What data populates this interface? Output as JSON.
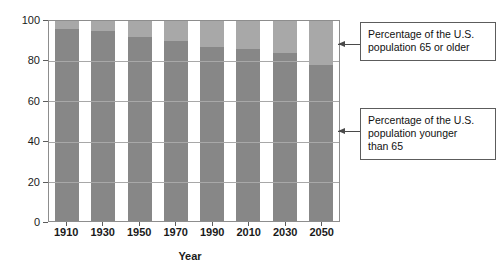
{
  "chart_data": {
    "type": "bar",
    "title": "",
    "subtitle": "",
    "xlabel": "Year",
    "ylabel": "Percentage",
    "categories": [
      "1910",
      "1930",
      "1950",
      "1970",
      "1990",
      "2010",
      "2030",
      "2050"
    ],
    "series": [
      {
        "name": "Percentage of the U.S. population younger than 65",
        "values": [
          96,
          95,
          92,
          90,
          87,
          86,
          84,
          78
        ],
        "color": "#878787"
      },
      {
        "name": "Percentage of the U.S. population 65 or older",
        "values": [
          4,
          5,
          8,
          10,
          13,
          14,
          16,
          22
        ],
        "color": "#a8a8a8"
      }
    ],
    "stacked": true,
    "ylim": [
      0,
      100
    ],
    "yticks": [
      "0",
      "20",
      "40",
      "60",
      "80",
      "100"
    ],
    "grid": true,
    "grid_axis": "y",
    "legend": "annotations"
  },
  "axes": {
    "y_title": "Percentage",
    "x_title": "Year",
    "y_ticks": [
      "100",
      "80",
      "60",
      "40",
      "20",
      "0"
    ],
    "x_ticks": [
      "1910",
      "1930",
      "1950",
      "1970",
      "1990",
      "2010",
      "2030",
      "2050"
    ]
  },
  "annotations": {
    "older": {
      "line1": "Percentage of the U.S.",
      "line2": "population 65 or older",
      "arrow": "left-arrow-icon"
    },
    "younger": {
      "line1": "Percentage of the U.S.",
      "line2": "population younger",
      "line3": "than 65",
      "arrow": "left-arrow-icon"
    }
  },
  "colors": {
    "bar_young": "#878787",
    "bar_old": "#a8a8a8",
    "frame": "#8d8d8d",
    "gridline": "#a8a8a8",
    "background": "#ffffff",
    "text": "#1a1a1a"
  }
}
